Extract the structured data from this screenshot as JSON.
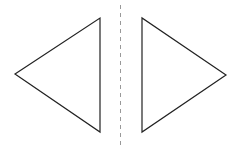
{
  "diagram": {
    "type": "reflection-symmetry",
    "line_of_symmetry": {
      "x": 120.5,
      "y1": 5,
      "y2": 147,
      "style": "dashed",
      "color": "#999999"
    },
    "shapes": [
      {
        "name": "left-triangle",
        "points": "15,74 100,18 100,132",
        "stroke": "#222222",
        "fill": "#ffffff"
      },
      {
        "name": "right-triangle",
        "points": "142,18 142,132 226,75",
        "stroke": "#222222",
        "fill": "#ffffff"
      }
    ]
  }
}
